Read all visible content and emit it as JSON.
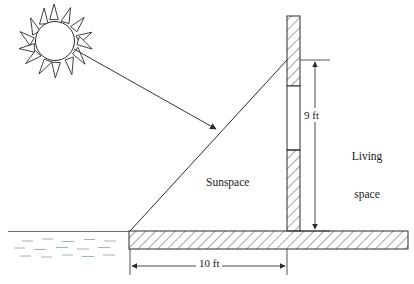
{
  "diagram": {
    "labels": {
      "sunspace": "Sunspace",
      "living_line1": "Living",
      "living_line2": "space",
      "height_dimension": "9 ft",
      "width_dimension": "10 ft"
    },
    "elements": {
      "sun": "sun-icon",
      "sun_ray": "solar-ray-arrow",
      "glazing": "sunspace-glazing-line",
      "mass_wall": "thermal-mass-wall",
      "window_opening": "wall-window-opening",
      "floor_slab": "floor-slab",
      "earth": "earth-ground"
    },
    "colors": {
      "line": "#2b2b2b",
      "hatch": "#3a3a3a",
      "background": "#ffffff",
      "earth_tint": "#8fa8a0"
    },
    "geometry": {
      "wall_left_x": 287,
      "wall_right_x": 300,
      "wall_top_y": 16,
      "slab_top_y": 231,
      "slab_bottom_y": 249,
      "slab_left_x": 129,
      "slab_right_x": 408,
      "window_top_y": 86,
      "window_bottom_y": 150,
      "glazing_top_y": 60,
      "dim_vertical_x": 315,
      "dim_horizontal_y": 266
    }
  }
}
